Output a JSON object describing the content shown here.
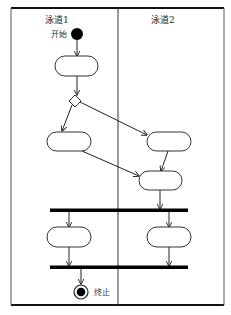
{
  "diagram": {
    "type": "UML activity diagram with swimlanes",
    "lanes": [
      {
        "id": "lane1",
        "title": "泳道1"
      },
      {
        "id": "lane2",
        "title": "泳道2"
      }
    ],
    "start": {
      "label": "开始",
      "lane": "lane1"
    },
    "end": {
      "label": "终止",
      "lane": "lane1"
    },
    "nodes": [
      {
        "id": "a1",
        "kind": "activity",
        "lane": "lane1",
        "label": ""
      },
      {
        "id": "d1",
        "kind": "decision",
        "lane": "lane1"
      },
      {
        "id": "a2",
        "kind": "activity",
        "lane": "lane1",
        "label": ""
      },
      {
        "id": "a3",
        "kind": "activity",
        "lane": "lane2",
        "label": ""
      },
      {
        "id": "a4",
        "kind": "activity",
        "lane": "lane2",
        "label": ""
      },
      {
        "id": "f1",
        "kind": "fork"
      },
      {
        "id": "a5",
        "kind": "activity",
        "lane": "lane1",
        "label": ""
      },
      {
        "id": "a6",
        "kind": "activity",
        "lane": "lane2",
        "label": ""
      },
      {
        "id": "j1",
        "kind": "join"
      }
    ],
    "edges": [
      [
        "start",
        "a1"
      ],
      [
        "a1",
        "d1"
      ],
      [
        "d1",
        "a2"
      ],
      [
        "d1",
        "a3"
      ],
      [
        "a2",
        "a4"
      ],
      [
        "a3",
        "a4"
      ],
      [
        "a4",
        "f1"
      ],
      [
        "f1",
        "a5"
      ],
      [
        "f1",
        "a6"
      ],
      [
        "a5",
        "j1"
      ],
      [
        "a6",
        "j1"
      ],
      [
        "j1",
        "end"
      ]
    ]
  }
}
